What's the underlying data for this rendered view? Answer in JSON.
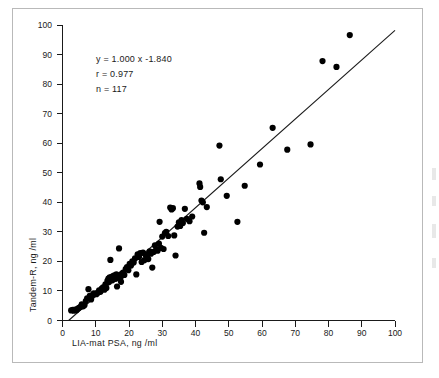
{
  "figure": {
    "name": "psa-method-comparison-scatter"
  },
  "annotation": {
    "equation": "y = 1.000 x -1.840",
    "correlation": "r = 0.977",
    "sample_size": "n = 117"
  },
  "axes": {
    "x_title": "LIA-mat PSA, ng /ml",
    "y_title": "Tandem-R, ng /ml",
    "x_ticks": [
      "0",
      "10",
      "20",
      "30",
      "40",
      "50",
      "60",
      "70",
      "80",
      "90",
      "100"
    ],
    "y_ticks": [
      "0",
      "10",
      "20",
      "30",
      "40",
      "50",
      "60",
      "70",
      "80",
      "90",
      "100"
    ]
  },
  "chart_data": {
    "type": "scatter",
    "title": "",
    "subtitle": "",
    "xlabel": "LIA-mat PSA, ng /ml",
    "ylabel": "Tandem-R, ng /ml",
    "xlim": [
      0,
      100
    ],
    "ylim": [
      0,
      100
    ],
    "xticks": [
      0,
      10,
      20,
      30,
      40,
      50,
      60,
      70,
      80,
      90,
      100
    ],
    "yticks": [
      0,
      10,
      20,
      30,
      40,
      50,
      60,
      70,
      80,
      90,
      100
    ],
    "grid": false,
    "legend": null,
    "marker": {
      "shape": "circle",
      "color": "#000000",
      "size": 3.1
    },
    "annotations": [
      "y = 1.000 x -1.840",
      "r = 0.977",
      "n = 117"
    ],
    "regression": {
      "type": "line",
      "slope": 1.0,
      "intercept": -1.84,
      "equation": "y = 1.000 x -1.840",
      "r": 0.977,
      "n": 117,
      "x_start": 1.84,
      "x_end": 100,
      "color": "#1a1a1a"
    },
    "series": [
      {
        "name": "Patient samples",
        "color": "#000000",
        "points": [
          [
            2.6,
            3.4
          ],
          [
            3.1,
            3.6
          ],
          [
            3.4,
            3.3
          ],
          [
            3.8,
            3.7
          ],
          [
            4.2,
            3.5
          ],
          [
            4.6,
            4.0
          ],
          [
            5.0,
            4.3
          ],
          [
            5.4,
            4.6
          ],
          [
            5.8,
            5.5
          ],
          [
            6.2,
            4.8
          ],
          [
            6.6,
            5.2
          ],
          [
            7.0,
            6.6
          ],
          [
            7.4,
            7.5
          ],
          [
            7.8,
            10.6
          ],
          [
            8.2,
            8.3
          ],
          [
            8.6,
            7.1
          ],
          [
            9.0,
            8.6
          ],
          [
            9.4,
            9.2
          ],
          [
            9.8,
            9.0
          ],
          [
            10.2,
            8.9
          ],
          [
            10.6,
            9.4
          ],
          [
            11.0,
            10.2
          ],
          [
            11.4,
            9.7
          ],
          [
            11.8,
            10.8
          ],
          [
            12.2,
            11.2
          ],
          [
            12.6,
            10.4
          ],
          [
            12.9,
            12.2
          ],
          [
            13.2,
            11.0
          ],
          [
            13.5,
            13.4
          ],
          [
            13.8,
            14.2
          ],
          [
            14.0,
            13.0
          ],
          [
            14.2,
            14.6
          ],
          [
            14.4,
            20.5
          ],
          [
            14.6,
            14.0
          ],
          [
            14.8,
            14.8
          ],
          [
            15.0,
            13.6
          ],
          [
            15.2,
            15.0
          ],
          [
            15.4,
            14.4
          ],
          [
            15.6,
            15.3
          ],
          [
            15.8,
            14.9
          ],
          [
            16.0,
            14.1
          ],
          [
            16.2,
            15.6
          ],
          [
            16.4,
            11.5
          ],
          [
            16.6,
            14.7
          ],
          [
            16.8,
            15.2
          ],
          [
            17.0,
            24.4
          ],
          [
            17.2,
            15.0
          ],
          [
            17.4,
            14.3
          ],
          [
            17.6,
            13.1
          ],
          [
            17.8,
            15.8
          ],
          [
            18.2,
            16.2
          ],
          [
            18.6,
            15.4
          ],
          [
            19.0,
            17.4
          ],
          [
            19.4,
            18.1
          ],
          [
            19.8,
            17.0
          ],
          [
            20.2,
            19.2
          ],
          [
            20.6,
            18.6
          ],
          [
            21.0,
            20.0
          ],
          [
            21.4,
            19.6
          ],
          [
            21.8,
            21.0
          ],
          [
            22.2,
            15.6
          ],
          [
            22.6,
            22.4
          ],
          [
            23.0,
            21.5
          ],
          [
            23.4,
            22.8
          ],
          [
            23.8,
            19.8
          ],
          [
            24.2,
            23.0
          ],
          [
            24.6,
            20.4
          ],
          [
            25.0,
            22.2
          ],
          [
            25.4,
            21.8
          ],
          [
            25.8,
            20.8
          ],
          [
            26.2,
            23.4
          ],
          [
            26.6,
            22.6
          ],
          [
            27.0,
            17.9
          ],
          [
            27.4,
            23.2
          ],
          [
            27.8,
            25.4
          ],
          [
            28.2,
            24.0
          ],
          [
            28.6,
            23.6
          ],
          [
            29.0,
            26.0
          ],
          [
            29.2,
            33.4
          ],
          [
            29.6,
            24.6
          ],
          [
            30.0,
            28.4
          ],
          [
            30.4,
            24.2
          ],
          [
            30.8,
            29.6
          ],
          [
            31.2,
            30.0
          ],
          [
            31.8,
            28.6
          ],
          [
            32.4,
            38.2
          ],
          [
            32.8,
            37.6
          ],
          [
            33.2,
            38.0
          ],
          [
            33.6,
            28.8
          ],
          [
            34.0,
            22.0
          ],
          [
            34.6,
            31.8
          ],
          [
            35.0,
            33.2
          ],
          [
            35.4,
            32.0
          ],
          [
            35.8,
            34.0
          ],
          [
            36.2,
            33.0
          ],
          [
            36.8,
            37.8
          ],
          [
            37.4,
            34.4
          ],
          [
            38.2,
            33.6
          ],
          [
            39.0,
            35.2
          ],
          [
            41.2,
            46.4
          ],
          [
            41.4,
            45.2
          ],
          [
            41.8,
            40.6
          ],
          [
            42.2,
            40.0
          ],
          [
            42.6,
            29.7
          ],
          [
            43.4,
            38.4
          ],
          [
            47.2,
            59.2
          ],
          [
            47.6,
            47.8
          ],
          [
            49.4,
            42.2
          ],
          [
            52.6,
            33.4
          ],
          [
            54.8,
            45.6
          ],
          [
            59.4,
            52.8
          ],
          [
            63.2,
            65.2
          ],
          [
            67.6,
            57.8
          ],
          [
            74.6,
            59.6
          ],
          [
            78.2,
            87.8
          ],
          [
            82.4,
            85.8
          ],
          [
            86.4,
            96.6
          ]
        ]
      }
    ]
  }
}
